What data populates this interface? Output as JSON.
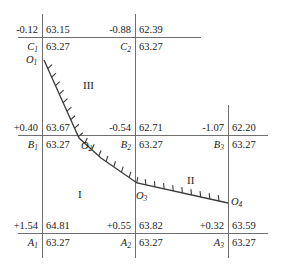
{
  "figure": {
    "width": 285,
    "height": 272,
    "background": "#ffffff",
    "line_color": "#6f6f72",
    "curve_color": "#3a3a3a",
    "text_color": "#1b1b1b"
  },
  "rows": [
    {
      "id": "row-c",
      "y_line": 37,
      "line_x1": 18,
      "line_x2": 201,
      "nodes": [
        {
          "id": "C1",
          "x": 42,
          "delta": "-0.12",
          "value": "63.15",
          "label": "C",
          "sub": "1",
          "base_value": "63.27"
        },
        {
          "id": "C2",
          "x": 135,
          "delta": "-0.88",
          "value": "62.39",
          "label": "C",
          "sub": "2",
          "base_value": "63.27"
        }
      ]
    },
    {
      "id": "row-b",
      "y_line": 135,
      "line_x1": 18,
      "line_x2": 268,
      "nodes": [
        {
          "id": "B1",
          "x": 42,
          "delta": "+0.40",
          "value": "63.67",
          "label": "B",
          "sub": "1",
          "base_value": "63.27"
        },
        {
          "id": "B2",
          "x": 135,
          "delta": "-0.54",
          "value": "62.71",
          "label": "B",
          "sub": "2",
          "base_value": "63.27"
        },
        {
          "id": "B3",
          "x": 228,
          "delta": "-1.07",
          "value": "62.20",
          "label": "B",
          "sub": "3",
          "base_value": "63.27"
        }
      ]
    },
    {
      "id": "row-a",
      "y_line": 233,
      "line_x1": 18,
      "line_x2": 268,
      "nodes": [
        {
          "id": "A1",
          "x": 42,
          "delta": "+1.54",
          "value": "64.81",
          "label": "A",
          "sub": "1",
          "base_value": "63.27"
        },
        {
          "id": "A2",
          "x": 135,
          "delta": "+0.55",
          "value": "63.82",
          "label": "A",
          "sub": "2",
          "base_value": "63.27"
        },
        {
          "id": "A3",
          "x": 228,
          "delta": "+0.32",
          "value": "63.59",
          "label": "A",
          "sub": "3",
          "base_value": "63.27"
        }
      ]
    }
  ],
  "verticals": [
    {
      "id": "vline-1",
      "x": 42,
      "y1": 14,
      "y2": 258
    },
    {
      "id": "vline-2",
      "x": 135,
      "y1": 14,
      "y2": 258
    },
    {
      "id": "vline-3",
      "x": 228,
      "y1": 105,
      "y2": 258
    }
  ],
  "curve": {
    "points": [
      {
        "id": "O1",
        "x": 44,
        "y": 60,
        "label": "O",
        "sub": "1",
        "label_x": 26,
        "label_y": 54
      },
      {
        "id": "O2",
        "x": 79,
        "y": 138,
        "label": "O",
        "sub": "2",
        "label_x": 81,
        "label_y": 140
      },
      {
        "id": "O3",
        "x": 137,
        "y": 183,
        "label": "O",
        "sub": "3",
        "label_x": 136,
        "label_y": 190
      },
      {
        "id": "O4",
        "x": 228,
        "y": 203,
        "label": "O",
        "sub": "4",
        "label_x": 231,
        "label_y": 196
      }
    ],
    "path": "M44,60 L79,138 L101,158 L137,183 L228,203",
    "tick_side": "right",
    "tick_length": 6,
    "tick_count": 26
  },
  "regions": [
    {
      "id": "region-III",
      "label": "III",
      "x": 83,
      "y": 79
    },
    {
      "id": "region-I",
      "label": "I",
      "x": 78,
      "y": 188
    },
    {
      "id": "region-II",
      "label": "II",
      "x": 187,
      "y": 174
    }
  ]
}
